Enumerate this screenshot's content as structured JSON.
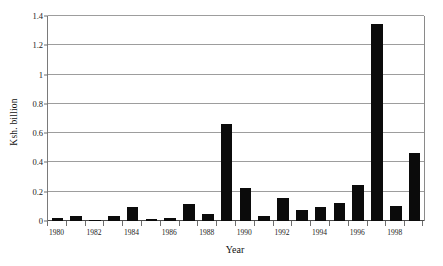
{
  "chart_data": {
    "type": "bar",
    "title": "",
    "xlabel": "Year",
    "ylabel": "Ksh. billion",
    "ylim": [
      0,
      1.4
    ],
    "yticks": [
      "0",
      "0.2",
      "0.4",
      "0.6",
      "0.8",
      "1",
      "1.2",
      "1.4"
    ],
    "ytick_values": [
      0,
      0.2,
      0.4,
      0.6,
      0.8,
      1.0,
      1.2,
      1.4
    ],
    "grid": true,
    "legend": "none",
    "bar_color": "#0b0b0b",
    "gridline_color": "#9d9d9d",
    "axis_color": "#6f6f6f",
    "categories": [
      "1980",
      "1981",
      "1982",
      "1983",
      "1984",
      "1985",
      "1986",
      "1987",
      "1988",
      "1989",
      "1990",
      "1991",
      "1992",
      "1993",
      "1994",
      "1995",
      "1996",
      "1997",
      "1998",
      "1999"
    ],
    "tick_labels": [
      "1980",
      "",
      "1982",
      "",
      "1984",
      "",
      "1986",
      "",
      "1988",
      "",
      "1990",
      "",
      "1992",
      "",
      "1994",
      "",
      "1996",
      "",
      "1998",
      ""
    ],
    "values": [
      0.022,
      0.035,
      0.006,
      0.033,
      0.098,
      0.012,
      0.023,
      0.115,
      0.045,
      0.665,
      0.225,
      0.031,
      0.155,
      0.073,
      0.098,
      0.12,
      0.245,
      1.345,
      0.102,
      0.462
    ]
  }
}
